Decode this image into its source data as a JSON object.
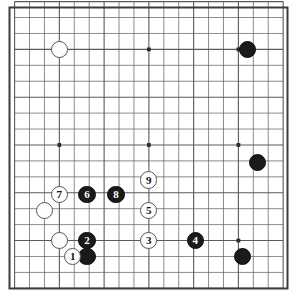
{
  "diagram": {
    "type": "go-board-diagram",
    "board_size": 19,
    "background_color": "#ffffff",
    "line_color": "#5a5a5a",
    "border_color": "#3c3c3c",
    "black_color": "#1a1a1a",
    "white_color": "#fdfdfd",
    "geometry": {
      "width": 294,
      "height": 303,
      "origin_x": 14.6,
      "origin_y": 1.6,
      "step_x": 14.92,
      "step_y": 15.93,
      "stone_radius": 8.6,
      "border_width": 2
    },
    "star_points": [
      {
        "col": 3,
        "row": 3
      },
      {
        "col": 9,
        "row": 3
      },
      {
        "col": 15,
        "row": 3
      },
      {
        "col": 3,
        "row": 9
      },
      {
        "col": 9,
        "row": 9
      },
      {
        "col": 15,
        "row": 9
      },
      {
        "col": 3,
        "row": 15
      },
      {
        "col": 9,
        "row": 15
      },
      {
        "col": 15,
        "row": 15
      }
    ],
    "stones": [
      {
        "id": "white-plain-1",
        "color": "white",
        "label": "",
        "col": 3,
        "row": 3
      },
      {
        "id": "black-plain-1",
        "color": "black",
        "label": "",
        "col": 15.6,
        "row": 3
      },
      {
        "id": "black-plain-2",
        "color": "black",
        "label": "",
        "col": 16.3,
        "row": 10.1
      },
      {
        "id": "black-plain-3",
        "color": "black",
        "label": "",
        "col": 15.3,
        "row": 16
      },
      {
        "id": "white-plain-2",
        "color": "white",
        "label": "",
        "col": 2,
        "row": 13.1
      },
      {
        "id": "white-plain-3",
        "color": "white",
        "label": "",
        "col": 3,
        "row": 15
      },
      {
        "id": "black-plain-4",
        "color": "black",
        "label": "",
        "col": 4.85,
        "row": 16
      },
      {
        "id": "move-7",
        "color": "white",
        "label": "7",
        "col": 3,
        "row": 12.1
      },
      {
        "id": "move-6",
        "color": "black",
        "label": "6",
        "col": 4.85,
        "row": 12.1
      },
      {
        "id": "move-8",
        "color": "black",
        "label": "8",
        "col": 6.8,
        "row": 12.1
      },
      {
        "id": "move-9",
        "color": "white",
        "label": "9",
        "col": 9,
        "row": 11.2
      },
      {
        "id": "move-5",
        "color": "white",
        "label": "5",
        "col": 9,
        "row": 13.1
      },
      {
        "id": "move-3",
        "color": "white",
        "label": "3",
        "col": 9,
        "row": 15
      },
      {
        "id": "move-4",
        "color": "black",
        "label": "4",
        "col": 12.1,
        "row": 15
      },
      {
        "id": "move-2",
        "color": "black",
        "label": "2",
        "col": 4.85,
        "row": 15
      },
      {
        "id": "move-1",
        "color": "white",
        "label": "1",
        "col": 3.9,
        "row": 16
      }
    ],
    "move_labels": [
      "1",
      "2",
      "3",
      "4",
      "5",
      "6",
      "7",
      "8",
      "9"
    ]
  }
}
